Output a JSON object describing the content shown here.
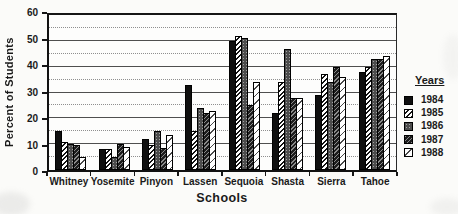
{
  "figure": {
    "background": "#fbfbf9",
    "ink_color": "#1a1a1a",
    "gridline_major_color": "#4f4f4f",
    "gridline_minor_color": "#8f8f8f"
  },
  "chart_data": {
    "type": "bar",
    "title": "",
    "xlabel": "Schools",
    "ylabel": "Percent of Students",
    "legend_title": "Years",
    "legend_position": "right",
    "grid": true,
    "ylim": [
      0,
      60
    ],
    "y_major_step": 10,
    "y_minor_step": 5,
    "y_ticks": [
      0,
      10,
      20,
      30,
      40,
      50,
      60
    ],
    "categories": [
      "Whitney",
      "Yosemite",
      "Pinyon",
      "Lassen",
      "Sequoia",
      "Shasta",
      "Sierra",
      "Tahoe"
    ],
    "series": [
      {
        "name": "1984",
        "pattern": "solid-black",
        "values": [
          15,
          8,
          12,
          33,
          50,
          22,
          29,
          38
        ]
      },
      {
        "name": "1985",
        "pattern": "diagonal-hatch",
        "values": [
          11,
          8,
          9.5,
          15,
          52,
          34,
          37,
          40
        ]
      },
      {
        "name": "1986",
        "pattern": "dark-dots",
        "values": [
          10,
          5,
          15,
          24,
          51,
          47,
          34,
          43
        ]
      },
      {
        "name": "1987",
        "pattern": "dark-diagonal-hatch",
        "values": [
          9.5,
          10,
          8.5,
          22,
          25,
          28,
          40,
          43
        ]
      },
      {
        "name": "1988",
        "pattern": "sparse-dash",
        "values": [
          5,
          9,
          13.5,
          23,
          34,
          28,
          36,
          44
        ]
      }
    ]
  }
}
